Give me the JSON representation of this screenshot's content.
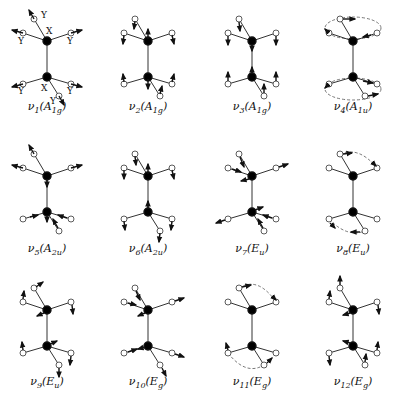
{
  "atom_labels": {
    "heavy": "X",
    "light": "Y"
  },
  "colors": {
    "line": "#333333",
    "heavy_atom": "#000000",
    "light_atom_fill": "#ffffff",
    "arrow": "#111111",
    "dashed": "#555555"
  },
  "modes": [
    {
      "id": "v1",
      "nu": "ν",
      "index": "1",
      "sym": "A",
      "sym_sub": "1g"
    },
    {
      "id": "v2",
      "nu": "ν",
      "index": "2",
      "sym": "A",
      "sym_sub": "1g"
    },
    {
      "id": "v3",
      "nu": "ν",
      "index": "3",
      "sym": "A",
      "sym_sub": "1g"
    },
    {
      "id": "v4",
      "nu": "ν",
      "index": "4",
      "sym": "A",
      "sym_sub": "1u"
    },
    {
      "id": "v5",
      "nu": "ν",
      "index": "5",
      "sym": "A",
      "sym_sub": "2u"
    },
    {
      "id": "v6",
      "nu": "ν",
      "index": "6",
      "sym": "A",
      "sym_sub": "2u"
    },
    {
      "id": "v7",
      "nu": "ν",
      "index": "7",
      "sym": "E",
      "sym_sub": "u"
    },
    {
      "id": "v8",
      "nu": "ν",
      "index": "8",
      "sym": "E",
      "sym_sub": "u"
    },
    {
      "id": "v9",
      "nu": "ν",
      "index": "9",
      "sym": "E",
      "sym_sub": "u"
    },
    {
      "id": "v10",
      "nu": "ν",
      "index": "10",
      "sym": "E",
      "sym_sub": "g"
    },
    {
      "id": "v11",
      "nu": "ν",
      "index": "11",
      "sym": "E",
      "sym_sub": "g"
    },
    {
      "id": "v12",
      "nu": "ν",
      "index": "12",
      "sym": "E",
      "sym_sub": "g"
    }
  ]
}
